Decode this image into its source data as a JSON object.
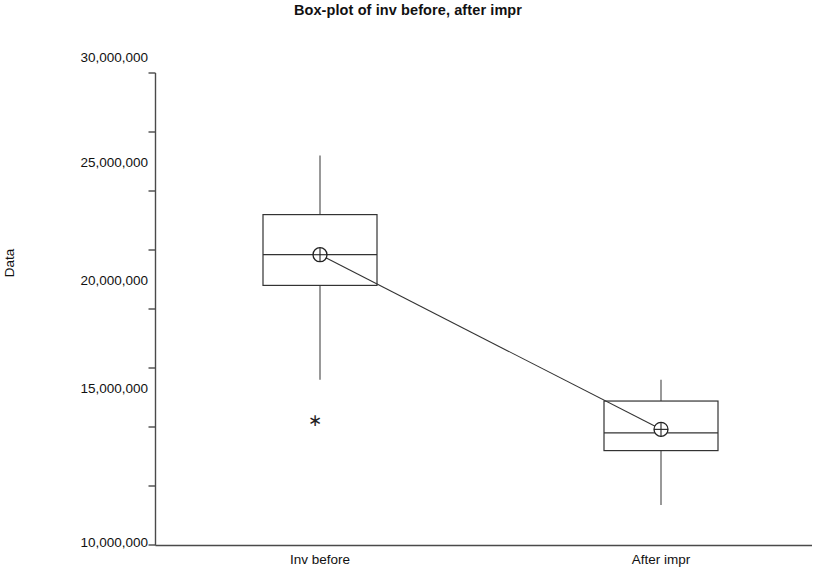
{
  "chart_data": {
    "type": "box",
    "title": "Box-plot of inv before, after impr",
    "xlabel": "",
    "ylabel": "Data",
    "categories": [
      "Inv before",
      "After impr"
    ],
    "ylim": [
      10000000,
      30000000
    ],
    "y_major_ticks": [
      10000000,
      15000000,
      20000000,
      25000000,
      30000000
    ],
    "y_tick_labels": [
      "10,000,000",
      "15,000,000",
      "20,000,000",
      "25,000,000",
      "30,000,000"
    ],
    "y_minor_ticks": [
      12500000,
      17500000,
      22500000,
      27500000
    ],
    "grid": false,
    "legend": null,
    "series": [
      {
        "name": "Inv before",
        "whisker_high": 26500000,
        "q3": 24000000,
        "median": 22300000,
        "mean": 22300000,
        "q1": 21000000,
        "whisker_low": 17000000,
        "outliers": [
          15300000
        ]
      },
      {
        "name": "After impr",
        "whisker_high": 17000000,
        "q3": 16100000,
        "median": 14750000,
        "mean": 14900000,
        "q1": 14000000,
        "whisker_low": 11700000,
        "outliers": []
      }
    ],
    "mean_connector": true,
    "colors": {
      "box_fill": "#ffffff",
      "box_stroke": "#333333",
      "axis": "#4a4a4a",
      "text": "#111111"
    }
  }
}
